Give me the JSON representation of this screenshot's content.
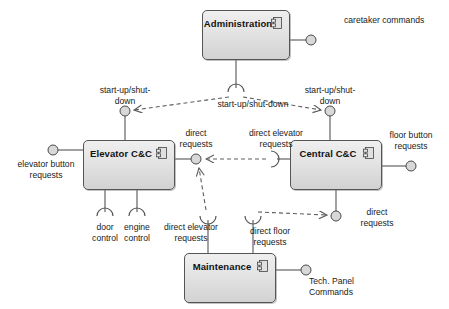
{
  "diagram": {
    "type": "uml-component-diagram",
    "colors": {
      "component_fill_top": "#efefef",
      "component_fill_bottom": "#d2d2d2",
      "component_border": "#555555",
      "connector_line": "#555555",
      "dependency_line": "#666666",
      "ball_fill": "#d8d8d8",
      "background": "#ffffff",
      "text": "#1a1a1a"
    },
    "components": [
      {
        "id": "administration",
        "name": "Administration",
        "x": 202,
        "y": 10,
        "w": 88,
        "h": 50
      },
      {
        "id": "elevator_cc",
        "name": "Elevator C&C",
        "x": 83,
        "y": 140,
        "w": 92,
        "h": 50
      },
      {
        "id": "central_cc",
        "name": "Central C&C",
        "x": 290,
        "y": 140,
        "w": 92,
        "h": 50
      },
      {
        "id": "maintenance",
        "name": "Maintenance",
        "x": 184,
        "y": 253,
        "w": 92,
        "h": 50
      }
    ],
    "provided_interfaces": [
      {
        "id": "caretaker-commands",
        "label": "caretaker commands",
        "cx": 311,
        "cy": 40,
        "label_x": 344,
        "label_y": 15,
        "label_w": 104
      },
      {
        "id": "startup-shutdown-left",
        "label": "start-up/shut-\ndown",
        "cx": 125,
        "cy": 111,
        "label_x": 125,
        "label_y": 85,
        "label_w": 86
      },
      {
        "id": "startup-shutdown-right",
        "label": "start-up/shut-\ndown",
        "cx": 330,
        "cy": 111,
        "label_x": 330,
        "label_y": 85,
        "label_w": 86
      },
      {
        "id": "direct-requests-left",
        "label": "direct\nrequests",
        "cx": 196,
        "cy": 159,
        "label_x": 196,
        "label_y": 130,
        "label_w": 66
      },
      {
        "id": "floor-button-requests",
        "label": "floor button\nrequests",
        "cx": 411,
        "cy": 166,
        "label_x": 411,
        "label_y": 131,
        "label_w": 74
      },
      {
        "id": "elevator-button-requests",
        "label": "elevator button\nrequests",
        "cx": 53,
        "cy": 150,
        "label_x": 47,
        "label_y": 160,
        "label_w": 92
      },
      {
        "id": "direct-requests-right",
        "label": "direct\nrequests",
        "cx": 336,
        "cy": 216,
        "label_x": 374,
        "label_y": 208,
        "label_w": 60
      },
      {
        "id": "tech-panel-commands",
        "label": "Tech. Panel\nCommands",
        "cx": 306,
        "cy": 270,
        "label_x": 307,
        "label_y": 278,
        "label_w": 76
      }
    ],
    "required_interfaces": [
      {
        "id": "startup-shutdown-admin",
        "label": "start-up/shut-down",
        "cx": 236,
        "cy": 92,
        "label_x": 253,
        "label_y": 99,
        "label_w": 110
      },
      {
        "id": "direct-elevator-requests-central",
        "label": "direct elevator\nrequests",
        "cx": 271,
        "cy": 159,
        "label_x": 275,
        "label_y": 130,
        "label_w": 82
      },
      {
        "id": "door-control",
        "label": "door\ncontrol",
        "cx": 105,
        "cy": 216,
        "label_x": 105,
        "label_y": 221,
        "label_w": 50
      },
      {
        "id": "engine-control",
        "label": "engine\ncontrol",
        "cx": 137,
        "cy": 216,
        "label_x": 137,
        "label_y": 221,
        "label_w": 54
      },
      {
        "id": "direct-elevator-requests-maint",
        "label": "direct elevator\nrequests",
        "cx": 208,
        "cy": 216,
        "label_x": 192,
        "label_y": 221,
        "label_w": 90
      },
      {
        "id": "direct-floor-requests",
        "label": "direct floor\nrequests",
        "cx": 253,
        "cy": 216,
        "label_x": 268,
        "label_y": 221,
        "label_w": 74
      }
    ],
    "dependencies": [
      {
        "id": "dep-admin-to-elevator",
        "from": "startup-shutdown-admin",
        "to": "startup-shutdown-left",
        "label": "start-up/shut-down"
      },
      {
        "id": "dep-admin-to-central",
        "from": "startup-shutdown-admin",
        "to": "startup-shutdown-right",
        "label": "start-up/shut-down"
      },
      {
        "id": "dep-central-to-elevator",
        "from": "direct-elevator-requests-central",
        "to": "direct-requests-left",
        "label": "direct elevator requests"
      },
      {
        "id": "dep-maint-to-elevator",
        "from": "direct-elevator-requests-maint",
        "to": "direct-requests-left",
        "label": "direct elevator requests"
      },
      {
        "id": "dep-maint-to-central",
        "from": "direct-floor-requests",
        "to": "direct-requests-right",
        "label": "direct floor requests"
      }
    ]
  }
}
